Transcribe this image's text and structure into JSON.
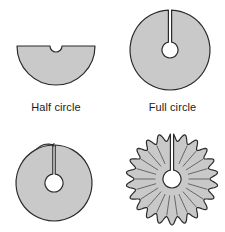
{
  "figure": {
    "background_color": "#ffffff",
    "shape_fill_color": "#c9c9c9",
    "shape_stroke_color": "#2b2b2b",
    "hole_fill_color": "#ffffff",
    "caption_text_color": "#1b1b1b",
    "width": 225,
    "height": 232
  },
  "panels": [
    {
      "id": "half-circle",
      "shape_name": "half-circle-with-notch",
      "caption": "Half circle",
      "description": "Semicircle with flat edge up and a small semicircular notch cut at the top center",
      "geometry": {
        "center_x": 56,
        "center_y": 16,
        "radius": 39,
        "notch_radius": 6
      }
    },
    {
      "id": "full-circle",
      "shape_name": "full-circle-with-hole-and-slit",
      "caption": "Full circle",
      "description": "Full disc with a circular hole at the center and a narrow radial slit running from the hole to the top edge",
      "geometry": {
        "center_x": 50,
        "center_y": 48,
        "radius": 40,
        "hole_radius": 8,
        "slit_half_width": 1.6
      }
    },
    {
      "id": "shallow-cone",
      "shape_name": "slit-disc-overlapped-shallow-cone",
      "caption": "",
      "description": "Disc with center hole and radial slit, edges slightly overlapped at the upper-left to form a shallow cone",
      "geometry": {
        "center_x": 48,
        "center_y": 55,
        "radius": 38,
        "hole_radius": 9,
        "slit_half_width": 1.2,
        "overlap_arc_degrees": 28
      }
    },
    {
      "id": "ruffled-disc",
      "shape_name": "ruffled-disc-with-hole-and-slit",
      "caption": "",
      "description": "Disc with center hole and radial slit whose rim is ruffled into many wavy lobes with radial crease lines",
      "geometry": {
        "center_x": 52,
        "center_y": 53,
        "outer_radius": 46,
        "wave_amplitude": 4,
        "lobe_count": 22,
        "hole_radius": 9,
        "slit_half_width": 1.6,
        "crease_inner_radius": 17
      }
    }
  ]
}
